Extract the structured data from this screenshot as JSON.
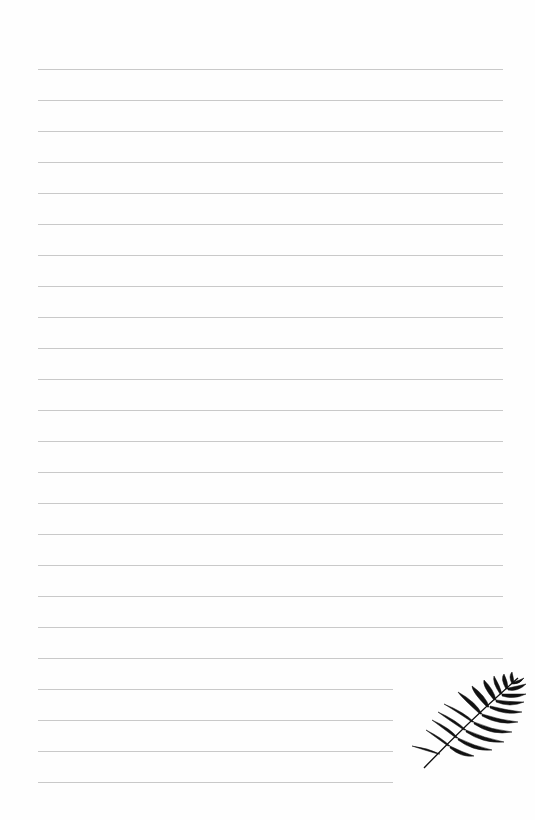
{
  "page": {
    "type": "lined-stationery",
    "background_color": "#fefefe",
    "line_color": "#c9c9c9",
    "line_count": 24,
    "full_width_lines": 20,
    "short_lines": 4,
    "line_spacing_px": 31
  },
  "decoration": {
    "icon": "palm-leaf-icon",
    "color": "#111111",
    "position": "bottom-right"
  }
}
